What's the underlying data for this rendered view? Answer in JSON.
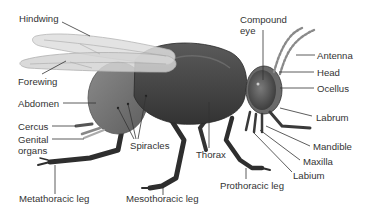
{
  "diagram": {
    "colors": {
      "body": "#4a4a4a",
      "abdomen": "#7a7a7a",
      "wing": "#d8d8d8",
      "eye": "#5c5c5c",
      "label_text": "#333333",
      "leader_line": "#333333",
      "background": "#ffffff"
    },
    "labels": {
      "hindwing": "Hindwing",
      "forewing": "Forewing",
      "abdomen": "Abdomen",
      "cercus": "Cercus",
      "genital_organs_1": "Genital",
      "genital_organs_2": "organs",
      "spiracles": "Spiracles",
      "metathoracic_leg": "Metathoracic leg",
      "mesothoracic_leg": "Mesothoracic leg",
      "thorax": "Thorax",
      "prothoracic_leg": "Prothoracic leg",
      "compound_eye_1": "Compound",
      "compound_eye_2": "eye",
      "antenna": "Antenna",
      "head": "Head",
      "ocellus": "Ocellus",
      "labrum": "Labrum",
      "mandible": "Mandible",
      "maxilla": "Maxilla",
      "labium": "Labium"
    }
  }
}
